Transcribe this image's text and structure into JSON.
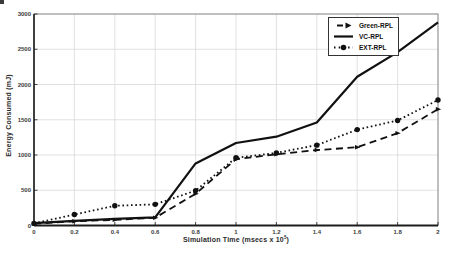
{
  "figure": {
    "background": "#ffffff"
  },
  "chart_data": {
    "type": "line",
    "title": "",
    "xlabel_prefix": "Simulation Time (msecs  x 10",
    "xlabel_exponent": "5",
    "xlabel_suffix": ")",
    "ylabel": "Energy Consumed (mJ)",
    "xlim": [
      0,
      2
    ],
    "ylim": [
      0,
      3000
    ],
    "grid": true,
    "legend_position": "top-right",
    "x": [
      0,
      0.2,
      0.4,
      0.6,
      0.8,
      1.0,
      1.2,
      1.4,
      1.6,
      1.8,
      2.0
    ],
    "xticks": [
      0,
      0.2,
      0.4,
      0.6,
      0.8,
      1.0,
      1.2,
      1.4,
      1.6,
      1.8,
      2.0
    ],
    "xticklabels": [
      "0",
      "0.2",
      "0.4",
      "0.6",
      "0.8",
      "1",
      "1.2",
      "1.4",
      "1.6",
      "1.8",
      "2"
    ],
    "yticks": [
      0,
      500,
      1000,
      1500,
      2000,
      2500,
      3000
    ],
    "yticklabels": [
      "0",
      "500",
      "1000",
      "1500",
      "2000",
      "2500",
      "3000"
    ],
    "series": [
      {
        "name": "Green-RPL",
        "style": "dashed",
        "marker": "arrow",
        "values": [
          25,
          60,
          80,
          110,
          450,
          940,
          1010,
          1070,
          1110,
          1310,
          1650
        ]
      },
      {
        "name": "VC-RPL",
        "style": "solid",
        "marker": "none",
        "values": [
          35,
          65,
          95,
          115,
          880,
          1170,
          1260,
          1460,
          2110,
          2460,
          2880
        ]
      },
      {
        "name": "EXT-RPL",
        "style": "dotted",
        "marker": "circle",
        "values": [
          30,
          155,
          280,
          300,
          495,
          960,
          1030,
          1140,
          1360,
          1490,
          1780
        ]
      }
    ],
    "colors": {
      "line": "#111111",
      "grid": "#d9d9d9",
      "axis": "#1c1c1c",
      "border": "#777777",
      "tick_text": "#3c3c3c"
    }
  }
}
